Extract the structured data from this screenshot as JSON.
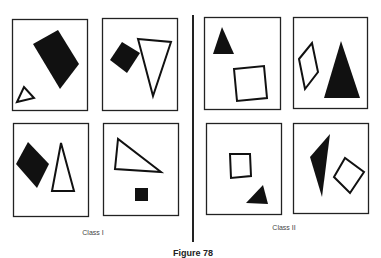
{
  "figure": {
    "caption": "Figure 78",
    "groups": [
      {
        "label": "Class I",
        "panels": [
          {
            "shapes": [
              "filled rectangle (rotated)",
              "outline triangle (small)"
            ]
          },
          {
            "shapes": [
              "filled square (rotated)",
              "outline triangle (inverted)"
            ]
          },
          {
            "shapes": [
              "filled diamond",
              "outline triangle (tall)"
            ]
          },
          {
            "shapes": [
              "outline triangle (obtuse)",
              "filled square (small)"
            ]
          }
        ]
      },
      {
        "label": "Class II",
        "panels": [
          {
            "shapes": [
              "filled triangle (small)",
              "outline square"
            ]
          },
          {
            "shapes": [
              "outline parallelogram",
              "filled triangle (large)"
            ]
          },
          {
            "shapes": [
              "outline square (small)",
              "filled triangle (small)"
            ]
          },
          {
            "shapes": [
              "filled triangle (narrow)",
              "outline diamond"
            ]
          }
        ]
      }
    ],
    "colors": {
      "ink": "#111111",
      "paper": "#ffffff"
    }
  }
}
